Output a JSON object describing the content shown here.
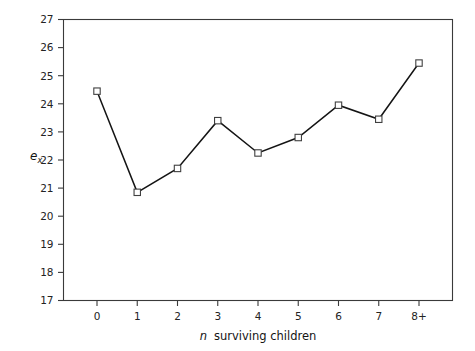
{
  "chart_data": {
    "type": "line",
    "title": "",
    "subtitle": "",
    "xlabel": "n  surviving children",
    "xlabel_italic_part": "n",
    "xlabel_rest": "surviving children",
    "ylabel": "e_x",
    "ylabel_base": "e",
    "ylabel_sub": "x",
    "categories": [
      "0",
      "1",
      "2",
      "3",
      "4",
      "5",
      "6",
      "7",
      "8+"
    ],
    "values": [
      24.45,
      20.85,
      21.7,
      23.4,
      22.25,
      22.8,
      23.95,
      23.45,
      25.45
    ],
    "series": [
      {
        "name": "e_x",
        "values": [
          24.45,
          20.85,
          21.7,
          23.4,
          22.25,
          22.8,
          23.95,
          23.45,
          25.45
        ]
      }
    ],
    "ylim": [
      17,
      27
    ],
    "ytick_labels": [
      "17",
      "18",
      "19",
      "20",
      "21",
      "22",
      "23",
      "24",
      "25",
      "26",
      "27"
    ],
    "ytick_values": [
      17,
      18,
      19,
      20,
      21,
      22,
      23,
      24,
      25,
      26,
      27
    ],
    "xtick_labels": [
      "0",
      "1",
      "2",
      "3",
      "4",
      "5",
      "6",
      "7",
      "8+"
    ],
    "grid": false,
    "legend": null,
    "legend_position": "none",
    "marker_style": "open-square",
    "line_color": "#141414",
    "marker_fill": "#ffffff",
    "marker_edge": "#404040",
    "axis_color": "#3a3a3a",
    "background": "#ffffff"
  }
}
